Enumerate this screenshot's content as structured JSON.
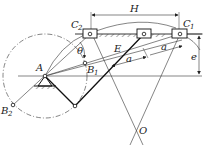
{
  "diagram": {
    "type": "offset slider-crank mechanism",
    "labels": {
      "H": "H",
      "C1": "C",
      "C1_sub": "1",
      "C2": "C",
      "C2_sub": "2",
      "theta": "θ",
      "E": "E",
      "a1": "a",
      "a2": "a",
      "A": "A",
      "B1": "B",
      "B1_sub": "1",
      "B2": "B",
      "B2_sub": "2",
      "e": "e",
      "O": "O"
    },
    "colors": {
      "line": "#222222",
      "background": "#ffffff"
    }
  }
}
